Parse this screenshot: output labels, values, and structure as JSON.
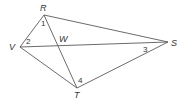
{
  "diagram": {
    "type": "geometry-quadrilateral",
    "stroke_color": "#5a5a5a",
    "text_color": "#333333",
    "vertices": {
      "R": {
        "label": "R",
        "x": 44,
        "y": 15
      },
      "V": {
        "label": "V",
        "x": 20,
        "y": 47
      },
      "S": {
        "label": "S",
        "x": 168,
        "y": 42
      },
      "T": {
        "label": "T",
        "x": 77,
        "y": 88
      },
      "W": {
        "label": "W",
        "x": 60,
        "y": 45
      }
    },
    "segments": [
      [
        "R",
        "S"
      ],
      [
        "S",
        "T"
      ],
      [
        "T",
        "V"
      ],
      [
        "V",
        "R"
      ],
      [
        "R",
        "T"
      ],
      [
        "V",
        "S"
      ]
    ],
    "angle_labels": {
      "a1": {
        "label": "1"
      },
      "a2": {
        "label": "2"
      },
      "a3": {
        "label": "3"
      },
      "a4": {
        "label": "4"
      }
    }
  }
}
